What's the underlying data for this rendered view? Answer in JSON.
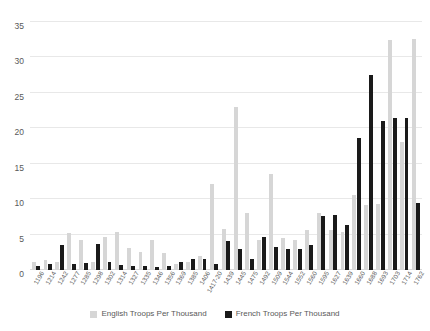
{
  "chart_data": {
    "type": "bar",
    "title": "",
    "subtitle": "",
    "xlabel": "",
    "ylabel": "",
    "ylim": [
      0,
      35
    ],
    "yticks": [
      0,
      5,
      10,
      15,
      20,
      25,
      30,
      35
    ],
    "grid": true,
    "legend_position": "bottom",
    "categories": [
      "1196",
      "1214",
      "1242",
      "1277",
      "1285",
      "1298",
      "1302",
      "1314",
      "1327",
      "1335",
      "1346",
      "1356",
      "1369",
      "1385",
      "1406",
      "1417-20",
      "1439",
      "1445",
      "1475",
      "1492",
      "1509",
      "1544",
      "1552",
      "1560",
      "1595",
      "1627",
      "1639",
      "1660",
      "1688",
      "1693",
      "1703",
      "1714",
      "1762"
    ],
    "series": [
      {
        "name": "English Troops Per Thousand",
        "color": "#d6d6d6",
        "values": [
          1.2,
          1.4,
          1.1,
          5.2,
          4.3,
          1.2,
          4.6,
          5.3,
          3.1,
          2.6,
          4.3,
          2.4,
          0.8,
          1.2,
          2.0,
          12.1,
          5.8,
          23.0,
          8.1,
          4.3,
          13.5,
          4.5,
          4.2,
          5.6,
          8.1,
          5.6,
          5.4,
          10.6,
          9.2,
          9.3,
          32.5,
          18.0,
          32.6
        ]
      },
      {
        "name": "French Troops Per Thousand",
        "color": "#1a1a1a",
        "values": [
          0.5,
          0.9,
          3.6,
          0.8,
          1.0,
          3.7,
          1.2,
          0.7,
          0.6,
          0.5,
          0.4,
          0.6,
          1.1,
          1.6,
          1.5,
          0.8,
          4.1,
          2.9,
          1.6,
          4.6,
          3.3,
          3.0,
          2.9,
          3.5,
          7.6,
          7.8,
          6.3,
          18.7,
          27.5,
          21.0,
          21.4,
          21.5,
          9.5
        ]
      }
    ]
  },
  "legend": {
    "items": [
      {
        "label": "English Troops Per Thousand",
        "color": "#d6d6d6"
      },
      {
        "label": "French Troops Per Thousand",
        "color": "#1a1a1a"
      }
    ]
  }
}
